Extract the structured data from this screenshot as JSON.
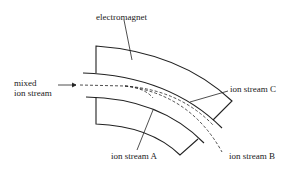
{
  "labels": {
    "electromagnet": "electromagnet",
    "mixed_line1": "mixed",
    "mixed_line2": "ion stream",
    "stream_a": "ion stream A",
    "stream_b": "ion stream B",
    "stream_c": "ion stream C"
  },
  "colors": {
    "line": "#222222",
    "background": "#ffffff"
  }
}
